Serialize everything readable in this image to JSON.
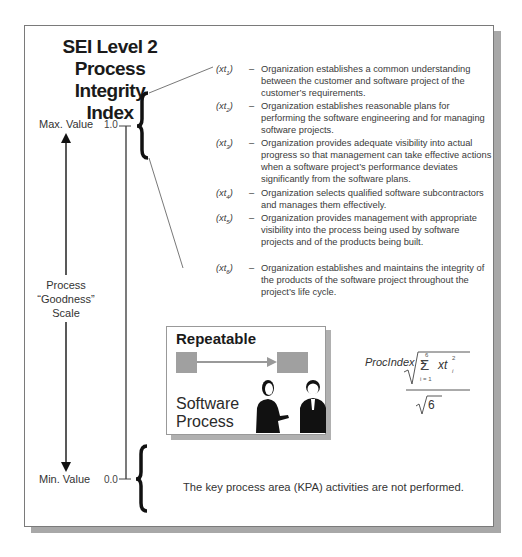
{
  "title": {
    "line1": "SEI Level 2",
    "line2": "Process Integrity",
    "line3": "Index"
  },
  "scale": {
    "max_label": "Max. Value",
    "min_label": "Min. Value",
    "max_value": "1.0",
    "min_value": "0.0",
    "center_label_1": "Process",
    "center_label_2": "“Goodness”",
    "center_label_3": "Scale"
  },
  "items": [
    {
      "tag": "(xt",
      "sub": "1",
      "close": ")",
      "dash": "–",
      "lines": [
        "Organization establishes a common understanding",
        "between the customer and software project of the",
        "customer’s requirements."
      ]
    },
    {
      "tag": "(xt",
      "sub": "2",
      "close": ")",
      "dash": "–",
      "lines": [
        "Organization establishes reasonable plans for",
        "performing the software engineering and for managing",
        "software projects."
      ]
    },
    {
      "tag": "(xt",
      "sub": "3",
      "close": ")",
      "dash": "–",
      "lines": [
        "Organization provides adequate visibility into actual",
        "progress so that management can take effective actions",
        "when a software project’s performance deviates",
        "significantly from the software plans."
      ]
    },
    {
      "tag": "(xt",
      "sub": "4",
      "close": ")",
      "dash": "–",
      "lines": [
        "Organization selects qualified software subcontractors",
        "and manages them effectively."
      ]
    },
    {
      "tag": "(xt",
      "sub": "5",
      "close": ")",
      "dash": "–",
      "lines": [
        "Organization provides management with appropriate",
        "visibility into the process being used by software",
        "projects and of the products being built."
      ]
    },
    {
      "tag": "(xt",
      "sub": "6",
      "close": ")",
      "dash": "–",
      "lines": [
        "Organization establishes and maintains the integrity of",
        "the products of the software project throughout the",
        "project’s life cycle."
      ]
    }
  ],
  "repeatable": {
    "title": "Repeatable",
    "label_line1": "Software",
    "label_line2": "Process"
  },
  "formula": {
    "lhs": "ProcIndex",
    "equals": "=",
    "sum_upper": "6",
    "sum_lower": "i = 1",
    "sigma": "Σ",
    "term": "xt",
    "term_sub": "i",
    "term_sup": "2",
    "denominator": "6"
  },
  "min_description": "The key process area (KPA) activities are not performed."
}
